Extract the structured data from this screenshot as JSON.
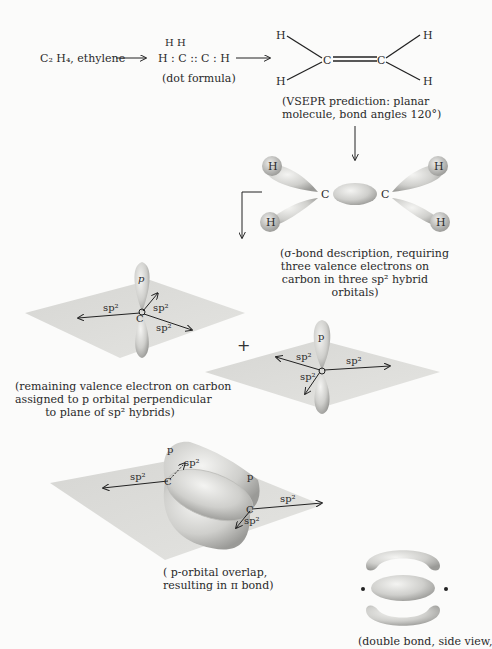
{
  "row1": {
    "formula_label": "C₂ H₄, ethylene",
    "dot_formula": {
      "top": "H   H",
      "main": "H : C :: C : H",
      "caption": "(dot formula)"
    },
    "vsepr": {
      "atoms": {
        "c1": "C",
        "c2": "C",
        "h": "H"
      },
      "caption_line1": "(VSEPR prediction: planar",
      "caption_line2": "molecule, bond angles 120°)"
    }
  },
  "sigma": {
    "atoms": {
      "c": "C",
      "h": "H"
    },
    "caption": [
      "(σ-bond description, requiring",
      "three valence electrons on",
      "carbon in three sp² hybrid",
      "orbitals)"
    ]
  },
  "hybrid": {
    "p_label": "p",
    "sp2_label": "sp²",
    "c_label": "C",
    "plus_sign": "+",
    "caption": [
      "(remaining valence electron on carbon",
      "assigned to p orbital perpendicular",
      "to plane of sp² hybrids)"
    ]
  },
  "pi": {
    "p_label": "p",
    "sp2_label": "sp²",
    "c_label": "C",
    "caption": [
      "( p-orbital overlap,",
      "resulting in π bond)"
    ]
  },
  "side_view": {
    "caption": "(double bond, side view,"
  }
}
